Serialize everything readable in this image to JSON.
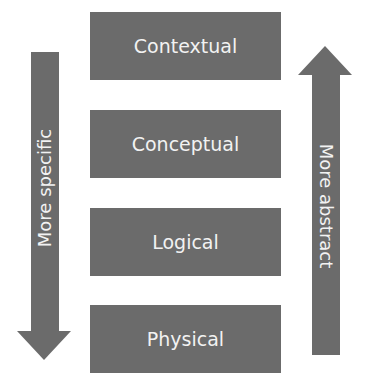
{
  "diagram": {
    "levels": [
      {
        "label": "Contextual"
      },
      {
        "label": "Conceptual"
      },
      {
        "label": "Logical"
      },
      {
        "label": "Physical"
      }
    ],
    "left_arrow": {
      "direction": "down",
      "label": "More specific"
    },
    "right_arrow": {
      "direction": "up",
      "label": "More abstract"
    },
    "colors": {
      "shape_fill": "#6b6b6b",
      "text": "#f2f2f2",
      "background": "#ffffff"
    }
  }
}
